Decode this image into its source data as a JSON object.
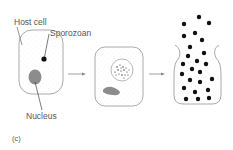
{
  "labels": {
    "host_cell": "Host cell",
    "sporozoan": "Sporozoan",
    "nucleus": "Nucleus",
    "panel": "(c)"
  },
  "colors": {
    "outline": "#9a9a9a",
    "stipple": "#c8c8c8",
    "nucleus_fill": "#8c8c8c",
    "dot": "#111111",
    "arrow": "#777777",
    "text": "#555555"
  },
  "stages": [
    {
      "name": "infected-host-cell",
      "description": "Host cell with single sporozoan and nucleus"
    },
    {
      "name": "multiplying-sporozoan",
      "description": "Sporozoan multiplying within vacuole"
    },
    {
      "name": "ruptured-cell",
      "description": "Cell ruptures releasing many sporozoans"
    }
  ]
}
